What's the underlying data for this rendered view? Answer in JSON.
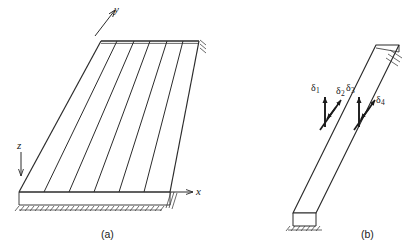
{
  "figure": {
    "type": "engineering-diagram",
    "background_color": "#ffffff",
    "line_color": "#2b2b2b",
    "width": 418,
    "height": 251,
    "panels": [
      {
        "id": "a",
        "caption": "(a)",
        "description": "skewed plate with parallel ribs and coordinate axes",
        "axes": [
          {
            "name": "y",
            "label": "y",
            "direction": "up-right"
          },
          {
            "name": "x",
            "label": "x",
            "direction": "right"
          },
          {
            "name": "z",
            "label": "z",
            "direction": "down"
          }
        ],
        "rib_count": 5,
        "supports": [
          "bottom-edge-hatched",
          "right-edge-hatched"
        ]
      },
      {
        "id": "b",
        "caption": "(b)",
        "description": "isometric beam element with four degrees of freedom",
        "dofs": [
          {
            "label": "δ",
            "subscript": "1",
            "kind": "translation"
          },
          {
            "label": "δ",
            "subscript": "2",
            "kind": "rotation"
          },
          {
            "label": "δ",
            "subscript": "3",
            "kind": "translation"
          },
          {
            "label": "δ",
            "subscript": "4",
            "kind": "rotation"
          }
        ],
        "supports": [
          "base-fixed-hatched",
          "far-end-hatched"
        ]
      }
    ]
  },
  "labels": {
    "axis_y": "y",
    "axis_x": "x",
    "axis_z": "z",
    "dof_1_symbol": "δ",
    "dof_1_sub": "1",
    "dof_2_symbol": "δ",
    "dof_2_sub": "2",
    "dof_3_symbol": "δ",
    "dof_3_sub": "3",
    "dof_4_symbol": "δ",
    "dof_4_sub": "4",
    "caption_a": "(a)",
    "caption_b": "(b)"
  }
}
